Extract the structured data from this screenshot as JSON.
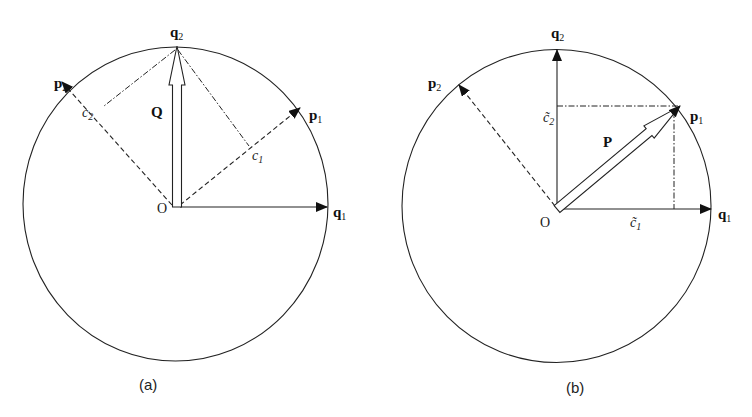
{
  "figure": {
    "panels": [
      {
        "id": "a",
        "caption": "(a)",
        "circle": {
          "cx": 175.5,
          "cy": 204,
          "rx": 152.5,
          "ry": 157
        },
        "origin": {
          "x": 176,
          "y": 207,
          "label": "O"
        },
        "vectors": {
          "q1": {
            "label": "q",
            "sub": "1",
            "tip": [
              327,
              207
            ]
          },
          "q2": {
            "label": "q",
            "sub": "2",
            "tip": [
              177,
              46
            ]
          },
          "p1": {
            "label": "p",
            "sub": "1",
            "tip": [
              300,
              108
            ]
          },
          "p2": {
            "label": "p",
            "sub": "2",
            "tip": [
              62,
              82
            ]
          }
        },
        "main_vector": {
          "label": "Q",
          "type": "hollow-arrow"
        },
        "projections": [
          {
            "label": "c",
            "sub": "2",
            "tilde": false
          },
          {
            "label": "c",
            "sub": "1",
            "tilde": false
          }
        ]
      },
      {
        "id": "b",
        "caption": "(b)",
        "circle": {
          "cx": 556.5,
          "cy": 206,
          "rx": 154.5,
          "ry": 156.5
        },
        "origin": {
          "x": 557,
          "y": 209,
          "label": "O"
        },
        "vectors": {
          "q1": {
            "label": "q",
            "sub": "1",
            "tip": [
              711,
              209
            ]
          },
          "q2": {
            "label": "q",
            "sub": "2",
            "tip": [
              557,
              50
            ]
          },
          "p1": {
            "label": "p",
            "sub": "1",
            "tip": [
              680,
              106
            ]
          },
          "p2": {
            "label": "p",
            "sub": "2",
            "tip": [
              459,
              85
            ]
          }
        },
        "main_vector": {
          "label": "P",
          "type": "hollow-arrow"
        },
        "projections": [
          {
            "label": "c",
            "sub": "2",
            "tilde": true,
            "glyph": "c̃"
          },
          {
            "label": "c",
            "sub": "1",
            "tilde": true,
            "glyph": "c̃"
          }
        ]
      }
    ]
  }
}
